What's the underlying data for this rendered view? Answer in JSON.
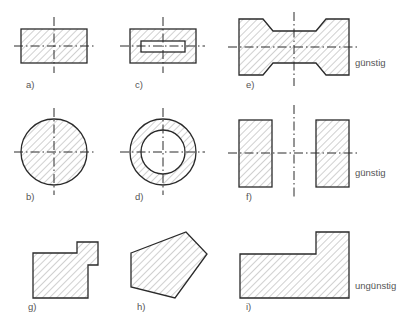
{
  "figure": {
    "colors": {
      "stroke": "#2a2a2a",
      "hatch": "#8a8a8a",
      "text": "#555555",
      "background": "#ffffff"
    },
    "rows": [
      {
        "rating": "günstig"
      },
      {
        "rating": "günstig"
      },
      {
        "rating": "ungünstig"
      }
    ],
    "items": [
      {
        "id": "a",
        "label": "a)",
        "shape": "rectangle"
      },
      {
        "id": "b",
        "label": "b)",
        "shape": "circle"
      },
      {
        "id": "c",
        "label": "c)",
        "shape": "rectangle with rectangular hole"
      },
      {
        "id": "d",
        "label": "d)",
        "shape": "ring"
      },
      {
        "id": "e",
        "label": "e)",
        "shape": "double-notched profile"
      },
      {
        "id": "f",
        "label": "f)",
        "shape": "two symmetric rectangles"
      },
      {
        "id": "g",
        "label": "g)",
        "shape": "stepped irregular polygon"
      },
      {
        "id": "h",
        "label": "h)",
        "shape": "irregular pentagon"
      },
      {
        "id": "i",
        "label": "i)",
        "shape": "L-shaped profile"
      }
    ]
  }
}
